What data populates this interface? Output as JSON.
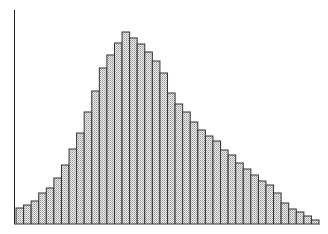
{
  "chart_data": {
    "type": "bar",
    "title": "",
    "xlabel": "",
    "ylabel": "",
    "grid": false,
    "legend": null,
    "categories": [
      1,
      2,
      3,
      4,
      5,
      6,
      7,
      8,
      9,
      10,
      11,
      12,
      13,
      14,
      15,
      16,
      17,
      18,
      19,
      20,
      21,
      22,
      23,
      24,
      25,
      26,
      27,
      28,
      29,
      30,
      31,
      32,
      33,
      34,
      35,
      36,
      37,
      38,
      39,
      40
    ],
    "values": [
      16,
      19,
      23,
      31,
      36,
      46,
      59,
      75,
      91,
      112,
      133,
      156,
      169,
      181,
      192,
      186,
      180,
      172,
      163,
      151,
      131,
      120,
      112,
      102,
      94,
      88,
      83,
      74,
      69,
      61,
      55,
      49,
      43,
      39,
      31,
      21,
      15,
      12,
      8,
      4
    ],
    "ylim": [
      0,
      214
    ],
    "style": {
      "bar_fill": "#d9d9d9",
      "bar_edge": "#333333",
      "axis_color": "#222222"
    }
  }
}
